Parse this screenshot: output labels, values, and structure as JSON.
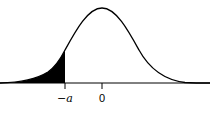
{
  "diagram": {
    "type": "normal-distribution-curve",
    "shaded_region": "left tail up to -a",
    "labels": {
      "neg_a": "−a",
      "zero": "0"
    }
  }
}
